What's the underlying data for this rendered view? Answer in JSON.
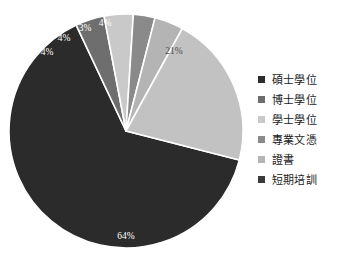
{
  "chart_data": {
    "type": "pie",
    "title": "",
    "subtitle": "",
    "xlabel": "",
    "ylabel": "",
    "grid": false,
    "legend_position": "right",
    "start_angle_deg": -90,
    "direction": "clockwise",
    "categories": [
      "碩士學位",
      "博士學位",
      "學士學位",
      "專業文憑",
      "證書",
      "短期培訓"
    ],
    "values": [
      4,
      4,
      3,
      4,
      21,
      64
    ],
    "labels": [
      "4%",
      "4%",
      "3%",
      "4%",
      "21%",
      "64%"
    ],
    "colors": [
      "#2b2b2b",
      "#6e6e6e",
      "#c9c9c9",
      "#8a8a8a",
      "#b4b4b4",
      "#3a3a3a"
    ],
    "slices": [
      {
        "name": "碩士學位",
        "value": 64,
        "label": "64%",
        "color": "#2b2b2b",
        "label_color": "#ffffff",
        "label_x": 126,
        "label_y": 237,
        "start_deg": 14.4,
        "end_deg": 244.8
      },
      {
        "name": "博士學位",
        "value": 4,
        "label": "4%",
        "color": "#6e6e6e",
        "label_color": "#ffffff",
        "label_x": 47,
        "label_y": 53,
        "start_deg": 244.8,
        "end_deg": 259.2
      },
      {
        "name": "學士學位",
        "value": 4,
        "label": "4%",
        "color": "#c9c9c9",
        "label_color": "#ffffff",
        "label_x": 64,
        "label_y": 39,
        "start_deg": 259.2,
        "end_deg": 273.6
      },
      {
        "name": "專業文憑",
        "value": 3,
        "label": "3%",
        "color": "#8a8a8a",
        "label_color": "#ffffff",
        "label_x": 85,
        "label_y": 29,
        "start_deg": 273.6,
        "end_deg": 284.4
      },
      {
        "name": "證書",
        "value": 4,
        "label": "4%",
        "color": "#b4b4b4",
        "label_color": "#ffffff",
        "label_x": 105,
        "label_y": 24,
        "start_deg": 284.4,
        "end_deg": 298.8
      },
      {
        "name": "短期培訓",
        "value": 21,
        "label": "21%",
        "color": "#c2c2c2",
        "label_color": "#4a4a4a",
        "label_x": 174,
        "label_y": 52,
        "start_deg": 298.8,
        "end_deg": 374.4
      }
    ]
  },
  "legend": {
    "items": [
      {
        "label": "碩士學位",
        "color": "#2b2b2b"
      },
      {
        "label": "博士學位",
        "color": "#6e6e6e"
      },
      {
        "label": "學士學位",
        "color": "#c9c9c9"
      },
      {
        "label": "專業文憑",
        "color": "#8a8a8a"
      },
      {
        "label": "證書",
        "color": "#b4b4b4"
      },
      {
        "label": "短期培訓",
        "color": "#3a3a3a"
      }
    ]
  },
  "geometry": {
    "center_x": 126,
    "center_y": 131,
    "radius": 117
  }
}
